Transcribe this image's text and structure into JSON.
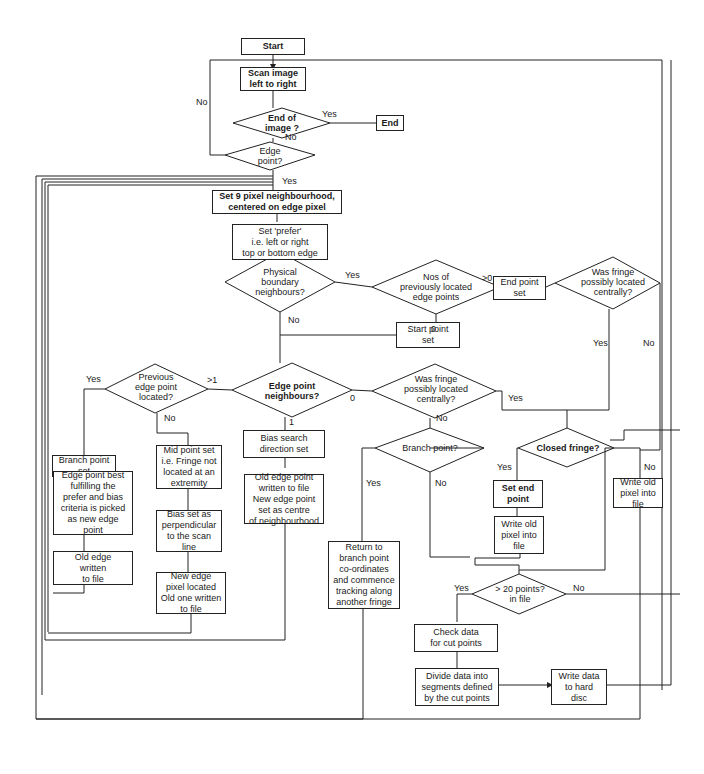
{
  "diagram": {
    "nodes": {
      "start": "Start",
      "scan": "Scan image\nleft to right",
      "end_of_image": "End of\nimage ?",
      "end": "End",
      "edge_point": "Edge\npoint?",
      "set_neighbourhood": "Set 9 pixel neighbourhood,\ncentered on edge pixel",
      "set_prefer": "Set 'prefer'\ni.e. left or right\ntop or bottom edge",
      "physical_boundary": "Physical\nboundary\nneighbours?",
      "nos_previously": "Nos of\npreviously located\nedge points",
      "end_point_set": "End point\nset",
      "was_fringe_top": "Was fringe\npossibly located\ncentrally?",
      "start_point_set": "Start point\nset",
      "previous_edge": "Previous\nedge point\nlocated?",
      "edge_point_neighbours": "Edge point\nneighbours?",
      "was_fringe_mid": "Was fringe\npossibly located\ncentrally?",
      "branch_point_set": "Branch point\nset",
      "edge_best": "Edge point best\nfulfilling the\nprefer and bias\ncriteria is picked\nas new edge\npoint",
      "old_edge_written": "Old edge\nwritten\nto file",
      "mid_point_set": "Mid point set\ni.e. Fringe not\nlocated at an\nextremity",
      "bias_perpendicular": "Bias set as\nperpendicular\nto the scan\nline",
      "new_edge_pixel": "New edge\npixel located\nOld one written\nto file",
      "bias_search": "Bias search\ndirection set",
      "old_edge_point_written": "Old edge point\nwritten to file\nNew edge point\nset as centre\nof neighbourhood",
      "branch_point_q": "Branch point?",
      "return_branch": "Return to\nbranch point\nco-ordinates\nand commence\ntracking along\nanother fringe",
      "closed_fringe": "Closed fringe?",
      "set_end_point": "Set end\npoint",
      "write_old_pixel_left": "Write old\npixel into\nfile",
      "write_old_pixel_right": "Write old\npixel into\nfile",
      "gt20_points": "> 20 points?\nin file",
      "check_data": "Check data\nfor cut points",
      "divide_data": "Divide data into\nsegments defined\nby the cut points",
      "write_hard_disc": "Write data\nto hard\ndisc"
    },
    "labels": {
      "no_scan_loop": "No",
      "yes_end": "Yes",
      "no_end_of_image": "No",
      "yes_edge_point": "Yes",
      "yes_physical": "Yes",
      "no_physical": "No",
      "gt0": ">0",
      "zero_nos": "0",
      "yes_was_fringe_top": "Yes",
      "no_was_fringe_top": "No",
      "yes_previous": "Yes",
      "no_previous": "No",
      "gt1": ">1",
      "one": "1",
      "zero_neighbours": "0",
      "yes_was_fringe_mid": "Yes",
      "no_was_fringe_mid": "No",
      "yes_branch": "Yes",
      "no_branch": "No",
      "yes_closed": "Yes",
      "no_closed": "No",
      "yes_gt20": "Yes",
      "no_gt20": "No"
    }
  }
}
